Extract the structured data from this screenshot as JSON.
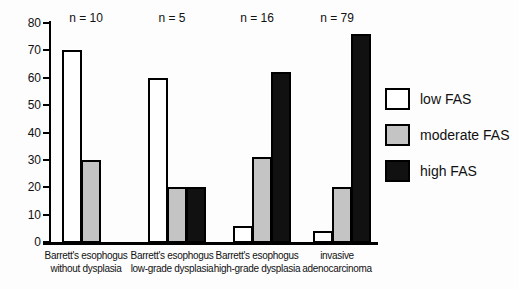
{
  "figure": {
    "background_color": "#fdfdfd",
    "bar_border_color": "#000000"
  },
  "chart_data": {
    "type": "bar",
    "title": "",
    "xlabel": "",
    "ylabel": "",
    "ylim": [
      0,
      80
    ],
    "yticks": [
      0,
      10,
      20,
      30,
      40,
      50,
      60,
      70,
      80
    ],
    "grid": false,
    "legend_position": "right-outside",
    "categories": [
      {
        "label_lines": [
          "Barrett's esophogus",
          "without dysplasia"
        ],
        "n_label": "n = 10"
      },
      {
        "label_lines": [
          "Barrett's esophogus",
          "low-grade dysplasia"
        ],
        "n_label": "n = 5"
      },
      {
        "label_lines": [
          "Barrett's esophogus",
          "high-grade dysplasia"
        ],
        "n_label": "n = 16"
      },
      {
        "label_lines": [
          "invasive",
          "adenocarcinoma"
        ],
        "n_label": "n = 79"
      }
    ],
    "series": [
      {
        "name": "low FAS",
        "fill": "#ffffff",
        "border": "#000000",
        "values": [
          70,
          60,
          6,
          4
        ]
      },
      {
        "name": "moderate FAS",
        "fill": "#c4c4c4",
        "border": "#000000",
        "values": [
          30,
          20,
          31,
          20
        ]
      },
      {
        "name": "high FAS",
        "fill": "#111111",
        "border": "#000000",
        "values": [
          0,
          20,
          62,
          76
        ]
      }
    ]
  }
}
